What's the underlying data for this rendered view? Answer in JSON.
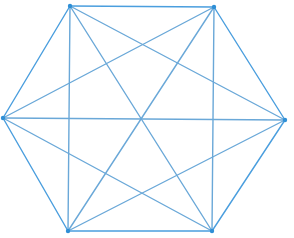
{
  "figure": {
    "name": "complete-graph-k6",
    "background_color": "#ffffff",
    "canvas": {
      "width": 294,
      "height": 238
    },
    "style": {
      "edge_color": "#4a9ede",
      "edge_color_alt": "#6aa8d8",
      "edge_width": 1.4,
      "vertex_color": "#2f8fd6",
      "vertex_radius": 2.2
    },
    "vertices": [
      {
        "id": "v1",
        "label": "top-left",
        "x": 70,
        "y": 6
      },
      {
        "id": "v2",
        "label": "top-right",
        "x": 214,
        "y": 7
      },
      {
        "id": "v3",
        "label": "right",
        "x": 285,
        "y": 120
      },
      {
        "id": "v4",
        "label": "bottom-right",
        "x": 212,
        "y": 231
      },
      {
        "id": "v5",
        "label": "bottom-left",
        "x": 68,
        "y": 231
      },
      {
        "id": "v6",
        "label": "left",
        "x": 3,
        "y": 118
      }
    ],
    "edges": [
      {
        "from": "v1",
        "to": "v2",
        "kind": "side"
      },
      {
        "from": "v2",
        "to": "v3",
        "kind": "side"
      },
      {
        "from": "v3",
        "to": "v4",
        "kind": "side"
      },
      {
        "from": "v4",
        "to": "v5",
        "kind": "side"
      },
      {
        "from": "v5",
        "to": "v6",
        "kind": "side"
      },
      {
        "from": "v6",
        "to": "v1",
        "kind": "side"
      },
      {
        "from": "v1",
        "to": "v3",
        "kind": "short-diagonal"
      },
      {
        "from": "v2",
        "to": "v4",
        "kind": "short-diagonal"
      },
      {
        "from": "v3",
        "to": "v5",
        "kind": "short-diagonal"
      },
      {
        "from": "v4",
        "to": "v6",
        "kind": "short-diagonal"
      },
      {
        "from": "v5",
        "to": "v1",
        "kind": "short-diagonal"
      },
      {
        "from": "v6",
        "to": "v2",
        "kind": "short-diagonal"
      },
      {
        "from": "v1",
        "to": "v4",
        "kind": "long-diagonal"
      },
      {
        "from": "v2",
        "to": "v5",
        "kind": "long-diagonal"
      },
      {
        "from": "v3",
        "to": "v6",
        "kind": "long-diagonal"
      }
    ],
    "center": {
      "x": 143,
      "y": 118
    },
    "edge_count": 15,
    "vertex_count": 6
  }
}
